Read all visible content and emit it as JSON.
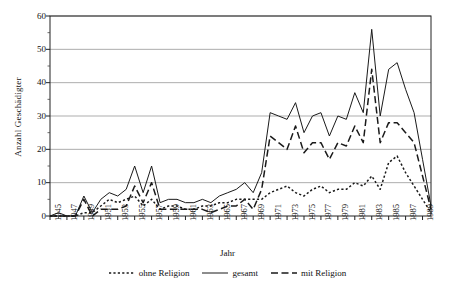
{
  "chart_data": {
    "type": "line",
    "title": "",
    "xlabel": "Jahr",
    "ylabel": "Anzahl Geschädigter",
    "xlim": [
      1945,
      1990
    ],
    "ylim": [
      0,
      60
    ],
    "ytick_step": 10,
    "yticks": [
      0,
      10,
      20,
      30,
      40,
      50,
      60
    ],
    "xticks": [
      1945,
      1947,
      1949,
      1951,
      1953,
      1955,
      1957,
      1959,
      1961,
      1963,
      1965,
      1967,
      1969,
      1971,
      1973,
      1975,
      1977,
      1979,
      1981,
      1983,
      1985,
      1987,
      1989
    ],
    "grid": "horizontal",
    "legend_position": "below-axis",
    "x": [
      1945,
      1946,
      1947,
      1948,
      1949,
      1950,
      1951,
      1952,
      1953,
      1954,
      1955,
      1956,
      1957,
      1958,
      1959,
      1960,
      1961,
      1962,
      1963,
      1964,
      1965,
      1966,
      1967,
      1968,
      1969,
      1970,
      1971,
      1972,
      1973,
      1974,
      1975,
      1976,
      1977,
      1978,
      1979,
      1980,
      1981,
      1982,
      1983,
      1984,
      1985,
      1986,
      1987,
      1988,
      1989,
      1990
    ],
    "series": [
      {
        "name": "gesamt",
        "style": "solid",
        "color": "#1a1a1a",
        "values": [
          0,
          1,
          0,
          0,
          6,
          1,
          5,
          7,
          6,
          8,
          15,
          7,
          15,
          4,
          5,
          5,
          4,
          4,
          5,
          4,
          6,
          7,
          8,
          10,
          7,
          13,
          31,
          30,
          29,
          34,
          25,
          30,
          31,
          24,
          30,
          29,
          37,
          31,
          56,
          30,
          44,
          46,
          38,
          31,
          17,
          3
        ]
      },
      {
        "name": "mit Religion",
        "style": "dashed",
        "color": "#1a1a1a",
        "values": [
          0,
          0,
          0,
          0,
          5,
          0,
          2,
          2,
          2,
          3,
          9,
          4,
          10,
          2,
          2,
          2,
          2,
          2,
          2,
          1,
          2,
          3,
          3,
          5,
          2,
          8,
          24,
          22,
          20,
          27,
          19,
          22,
          22,
          17,
          22,
          21,
          27,
          22,
          44,
          22,
          28,
          28,
          25,
          22,
          12,
          2
        ]
      },
      {
        "name": "ohne Religion",
        "style": "dotted",
        "color": "#1a1a1a",
        "values": [
          0,
          0,
          0,
          0,
          1,
          1,
          3,
          5,
          4,
          5,
          6,
          3,
          5,
          2,
          3,
          3,
          2,
          2,
          3,
          3,
          4,
          4,
          5,
          5,
          5,
          5,
          7,
          8,
          9,
          7,
          6,
          8,
          9,
          7,
          8,
          8,
          10,
          9,
          12,
          8,
          16,
          18,
          13,
          9,
          5,
          1
        ]
      }
    ],
    "legend": [
      {
        "label": "ohne Religion",
        "style": "dotted"
      },
      {
        "label": "gesamt",
        "style": "solid"
      },
      {
        "label": "mit Religion",
        "style": "dashed"
      }
    ]
  }
}
